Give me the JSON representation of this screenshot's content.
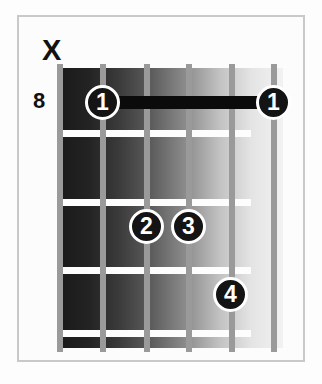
{
  "diagram": {
    "type": "guitar-chord-diagram",
    "open_mute_markers": [
      {
        "symbol": "X",
        "string_index": 0,
        "meaning": "muted"
      }
    ],
    "fret_number_label": "8",
    "strings_count": 6,
    "frets_count": 4,
    "barre": {
      "finger": "1",
      "fret": 1,
      "from_string_index": 1,
      "to_string_index": 5
    },
    "finger_markers": [
      {
        "label": "1",
        "string_index": 1,
        "fret": 1
      },
      {
        "label": "1",
        "string_index": 5,
        "fret": 1
      },
      {
        "label": "2",
        "string_index": 2,
        "fret": 3
      },
      {
        "label": "3",
        "string_index": 3,
        "fret": 3
      },
      {
        "label": "4",
        "string_index": 4,
        "fret": 4
      }
    ],
    "colors": {
      "background": "#fdfdfd",
      "frame_border": "#c9c9c9",
      "string": "#9a9a9a",
      "fret_line": "#fdfdfd",
      "marker_fill": "#141414",
      "marker_text": "#ffffff",
      "barre": "#0b0b0b",
      "text": "#111111"
    }
  }
}
